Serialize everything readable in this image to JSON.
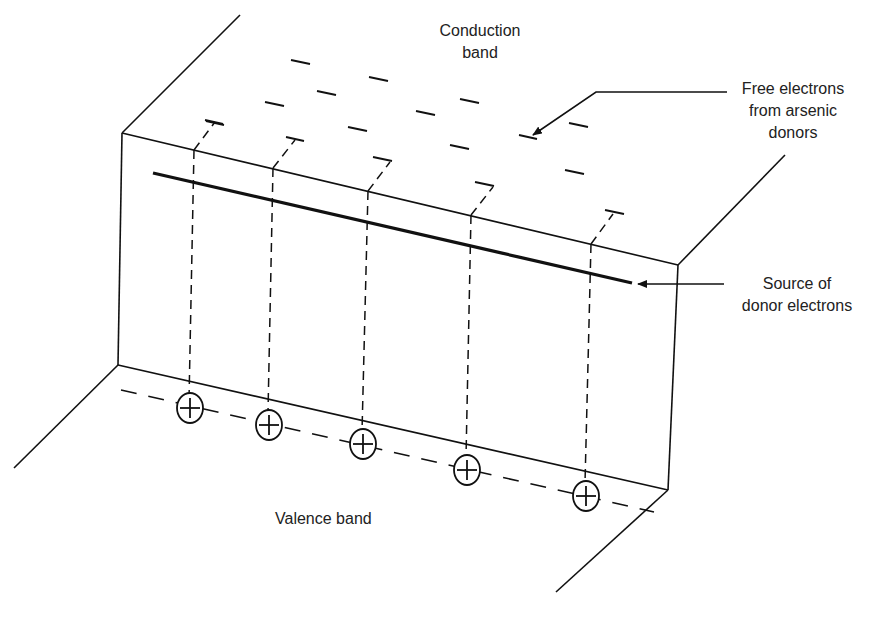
{
  "diagram": {
    "type": "energy-band-diagram",
    "colors": {
      "line": "#111111",
      "background": "#ffffff",
      "text": "#222222"
    },
    "labels": {
      "conduction_band": [
        "Conduction",
        "band"
      ],
      "free_electrons": [
        "Free electrons",
        "from arsenic",
        "donors"
      ],
      "donor_source": [
        "Source of",
        "donor electrons"
      ],
      "valence_band": "Valence band"
    },
    "symbols": {
      "electron": "minus-dash",
      "donor_ion": "circled-plus"
    },
    "counts": {
      "free_electrons": 17,
      "donor_ions": 5
    }
  }
}
